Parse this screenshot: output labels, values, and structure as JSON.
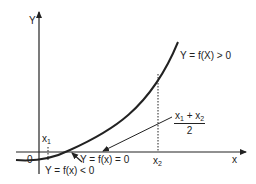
{
  "diagram": {
    "axes": {
      "y_label": "Y",
      "x_label": "x",
      "origin_label": "0"
    },
    "points": {
      "x1": {
        "base": "x",
        "sub": "1"
      },
      "x2": {
        "base": "x",
        "sub": "2"
      }
    },
    "midpoint": {
      "numerator_a": "x",
      "numerator_a_sub": "1",
      "plus": " + ",
      "numerator_b": "x",
      "numerator_b_sub": "2",
      "denominator": "2"
    },
    "annotations": {
      "positive": "Y = f(X) > 0",
      "zero": "Y = f(x) = 0",
      "negative": "Y = f(x) < 0"
    },
    "colors": {
      "ink": "#222222",
      "background": "#ffffff"
    }
  }
}
